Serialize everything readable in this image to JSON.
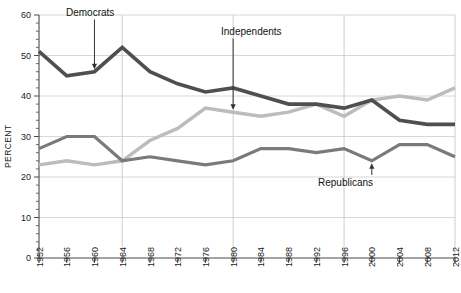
{
  "chart_data": {
    "type": "line",
    "title": "",
    "subtitle": "",
    "xlabel": "",
    "ylabel": "PERCENT",
    "ylim": [
      0,
      60
    ],
    "ytick_step": 10,
    "yticks": [
      "0",
      "10",
      "20",
      "30",
      "40",
      "50",
      "60"
    ],
    "grid": "both-light",
    "legend_position": "inline-annotations",
    "categories": [
      "1952",
      "1956",
      "1960",
      "1964",
      "1968",
      "1972",
      "1976",
      "1980",
      "1984",
      "1988",
      "1992",
      "1996",
      "2000",
      "2004",
      "2008",
      "2012"
    ],
    "x": [
      1952,
      1956,
      1960,
      1964,
      1968,
      1972,
      1976,
      1980,
      1984,
      1988,
      1992,
      1996,
      2000,
      2004,
      2008,
      2012
    ],
    "series": [
      {
        "name": "Democrats",
        "color": "#4f4f4f",
        "values": [
          51,
          45,
          46,
          52,
          46,
          43,
          41,
          42,
          40,
          38,
          38,
          37,
          39,
          34,
          33,
          33
        ]
      },
      {
        "name": "Independents",
        "color": "#bcbcbc",
        "values": [
          23,
          24,
          23,
          24,
          29,
          32,
          37,
          36,
          35,
          36,
          38,
          35,
          39,
          40,
          39,
          42
        ]
      },
      {
        "name": "Republicans",
        "color": "#7a7a7a",
        "values": [
          27,
          30,
          30,
          24,
          25,
          24,
          23,
          24,
          27,
          27,
          26,
          27,
          24,
          28,
          28,
          25
        ]
      }
    ],
    "annotations": [
      {
        "label": "Democrats",
        "points_to_series": "Democrats",
        "points_to_x": 1960
      },
      {
        "label": "Independents",
        "points_to_series": "Independents",
        "points_to_x": 1980
      },
      {
        "label": "Republicans",
        "points_to_series": "Republicans",
        "points_to_x": 2000
      }
    ],
    "colors": {
      "democrats": "#4f4f4f",
      "independents": "#bcbcbc",
      "republicans": "#7a7a7a",
      "axis": "#4a4a4a",
      "grid": "#c8c8c8",
      "background": "#ffffff"
    }
  }
}
